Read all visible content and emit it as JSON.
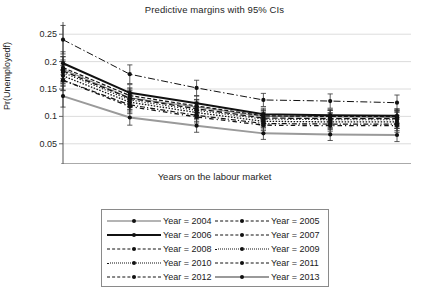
{
  "chart_data": {
    "type": "line",
    "title": "Predictive margins with 95% CIs",
    "xlabel": "Years on the labour market",
    "ylabel": "Pr(Unemployedf)",
    "x": [
      0,
      1,
      2,
      3,
      4,
      5
    ],
    "xticklabels": [
      "0",
      "1",
      "2",
      "3",
      "4",
      "5"
    ],
    "yticklabels": [
      "0.05",
      "0.1",
      "0.15",
      "0.2",
      "0.25"
    ],
    "yticks": [
      0.05,
      0.1,
      0.15,
      0.2,
      0.25
    ],
    "ylim": [
      0.035,
      0.265
    ],
    "xlim": [
      -0.25,
      5.25
    ],
    "grid": "horizontal",
    "legend_position": "below-center",
    "error_bars": "95% CI",
    "series": [
      {
        "name": "Year = 2004",
        "style": "solid-thin",
        "color": "#6b6b6b",
        "values": [
          0.186,
          0.134,
          0.117,
          0.1,
          0.099,
          0.098
        ],
        "ci_low": [
          0.163,
          0.118,
          0.104,
          0.089,
          0.087,
          0.085
        ],
        "ci_high": [
          0.209,
          0.15,
          0.13,
          0.111,
          0.111,
          0.111
        ]
      },
      {
        "name": "Year = 2005",
        "style": "dash-dot",
        "color": "#111111",
        "values": [
          0.24,
          0.177,
          0.152,
          0.13,
          0.128,
          0.125
        ],
        "ci_low": [
          0.214,
          0.16,
          0.138,
          0.118,
          0.115,
          0.111
        ],
        "ci_high": [
          0.266,
          0.194,
          0.166,
          0.142,
          0.141,
          0.139
        ]
      },
      {
        "name": "Year = 2006",
        "style": "solid-thick",
        "color": "#111111",
        "values": [
          0.197,
          0.143,
          0.124,
          0.104,
          0.102,
          0.101
        ],
        "ci_low": [
          0.176,
          0.128,
          0.111,
          0.093,
          0.091,
          0.088
        ],
        "ci_high": [
          0.218,
          0.158,
          0.137,
          0.115,
          0.113,
          0.114
        ]
      },
      {
        "name": "Year = 2007",
        "style": "dashed-medium",
        "color": "#111111",
        "values": [
          0.189,
          0.138,
          0.119,
          0.101,
          0.1,
          0.1
        ],
        "ci_low": [
          0.169,
          0.124,
          0.107,
          0.09,
          0.089,
          0.087
        ],
        "ci_high": [
          0.209,
          0.152,
          0.131,
          0.112,
          0.111,
          0.113
        ]
      },
      {
        "name": "Year = 2008",
        "style": "dashed-long",
        "color": "#111111",
        "values": [
          0.183,
          0.133,
          0.114,
          0.097,
          0.096,
          0.096
        ],
        "ci_low": [
          0.163,
          0.119,
          0.102,
          0.086,
          0.085,
          0.083
        ],
        "ci_high": [
          0.203,
          0.147,
          0.126,
          0.108,
          0.107,
          0.109
        ]
      },
      {
        "name": "Year = 2009",
        "style": "dotted-fine",
        "color": "#111111",
        "values": [
          0.18,
          0.13,
          0.111,
          0.095,
          0.094,
          0.094
        ],
        "ci_low": [
          0.16,
          0.116,
          0.099,
          0.084,
          0.083,
          0.081
        ],
        "ci_high": [
          0.2,
          0.144,
          0.123,
          0.106,
          0.105,
          0.107
        ]
      },
      {
        "name": "Year = 2010",
        "style": "dotted-dense",
        "color": "#111111",
        "values": [
          0.174,
          0.126,
          0.107,
          0.091,
          0.09,
          0.09
        ],
        "ci_low": [
          0.155,
          0.112,
          0.096,
          0.081,
          0.08,
          0.078
        ],
        "ci_high": [
          0.193,
          0.14,
          0.118,
          0.101,
          0.1,
          0.102
        ]
      },
      {
        "name": "Year = 2011",
        "style": "dash-dot-short",
        "color": "#111111",
        "values": [
          0.166,
          0.121,
          0.102,
          0.087,
          0.086,
          0.086
        ],
        "ci_low": [
          0.148,
          0.108,
          0.091,
          0.077,
          0.076,
          0.074
        ],
        "ci_high": [
          0.184,
          0.134,
          0.113,
          0.097,
          0.096,
          0.098
        ]
      },
      {
        "name": "Year = 2012",
        "style": "dash-dot-wide",
        "color": "#111111",
        "values": [
          0.166,
          0.118,
          0.099,
          0.084,
          0.083,
          0.083
        ],
        "ci_low": [
          0.147,
          0.105,
          0.088,
          0.074,
          0.073,
          0.071
        ],
        "ci_high": [
          0.185,
          0.131,
          0.11,
          0.094,
          0.093,
          0.095
        ]
      },
      {
        "name": "Year = 2013",
        "style": "solid-grey-thick",
        "color": "#9a9a9a",
        "values": [
          0.137,
          0.098,
          0.083,
          0.069,
          0.067,
          0.066
        ],
        "ci_low": [
          0.117,
          0.084,
          0.071,
          0.058,
          0.056,
          0.054
        ],
        "ci_high": [
          0.157,
          0.112,
          0.095,
          0.08,
          0.078,
          0.078
        ]
      }
    ]
  },
  "legend": {
    "columns": [
      [
        {
          "label": "Year = 2004",
          "style": "solid-thin"
        },
        {
          "label": "Year = 2006",
          "style": "solid-thick"
        },
        {
          "label": "Year = 2008",
          "style": "dashed-long"
        },
        {
          "label": "Year = 2010",
          "style": "dotted-dense"
        },
        {
          "label": "Year = 2012",
          "style": "dash-dot-wide"
        }
      ],
      [
        {
          "label": "Year = 2005",
          "style": "dash-dot"
        },
        {
          "label": "Year = 2007",
          "style": "dashed-medium"
        },
        {
          "label": "Year = 2009",
          "style": "dotted-fine"
        },
        {
          "label": "Year = 2011",
          "style": "dash-dot-short"
        },
        {
          "label": "Year = 2013",
          "style": "solid-grey-thick"
        }
      ]
    ]
  },
  "colors": {
    "axis": "#555555",
    "grid": "#d8d8d8",
    "text": "#262626",
    "series_black": "#111111",
    "series_grey": "#9a9a9a",
    "legend_border": "#8a8a8a",
    "background": "#ffffff"
  }
}
